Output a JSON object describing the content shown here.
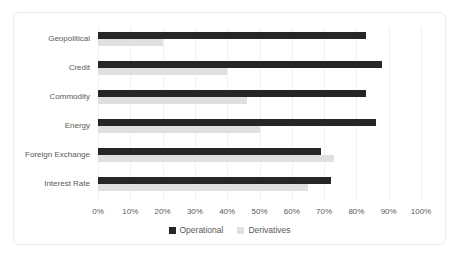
{
  "chart_data": {
    "type": "bar",
    "orientation": "horizontal",
    "title": "",
    "xlabel": "",
    "ylabel": "",
    "categories": [
      "Geopolitical",
      "Credit",
      "Commodity",
      "Energy",
      "Foreign Exchange",
      "Interest Rate"
    ],
    "series": [
      {
        "name": "Operational",
        "color": "#262626",
        "values": [
          83,
          88,
          83,
          86,
          69,
          72
        ]
      },
      {
        "name": "Derivatives",
        "color": "#e0e0e0",
        "values": [
          20,
          40,
          46,
          50,
          73,
          65
        ]
      }
    ],
    "xlim": [
      0,
      100
    ],
    "x_ticks": [
      "0%",
      "10%",
      "20%",
      "30%",
      "40%",
      "50%",
      "60%",
      "70%",
      "80%",
      "90%",
      "100%"
    ],
    "grid": "vertical",
    "gridline_color": "#f0f0f0",
    "legend_position": "bottom",
    "label_color": "#595959",
    "frame_border_color": "#ededed",
    "background_color": "#ffffff"
  }
}
